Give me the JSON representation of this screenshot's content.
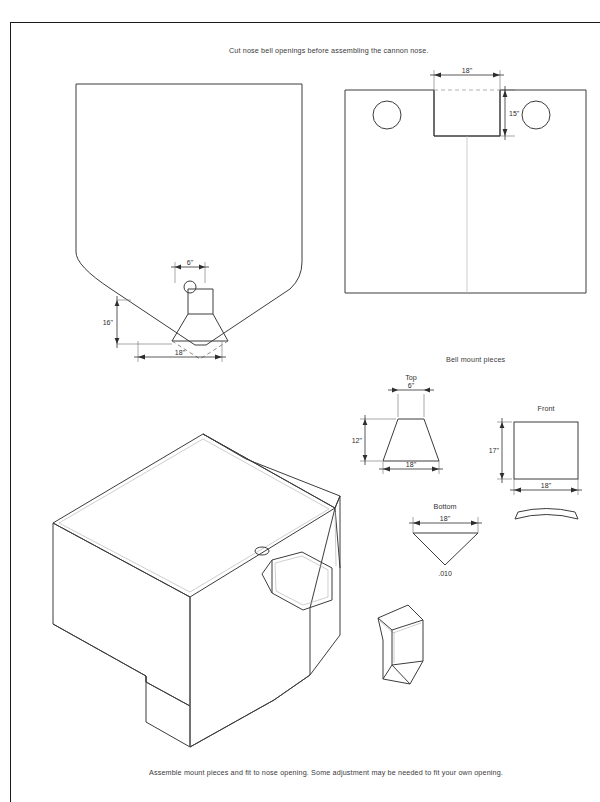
{
  "document": {
    "title": "Cannon nose bell opening templates",
    "background_color": "#ffffff",
    "line_color": "#3c3c3c",
    "frame_color": "#1a1a1a"
  },
  "captions": {
    "top": "Cut nose bell openings before assembling the cannon nose.",
    "bottom": "Assemble mount pieces and fit to nose opening. Some adjustment may be needed to fit your own opening."
  },
  "sections": {
    "bell_mount_label": "Bell mount pieces"
  },
  "views": {
    "nose_profile": {
      "name": "nose-profile-view",
      "dimensions": [
        {
          "label": "6\"",
          "orientation": "horizontal"
        },
        {
          "label": "16\"",
          "orientation": "vertical"
        },
        {
          "label": "18\"",
          "orientation": "horizontal"
        }
      ]
    },
    "nose_top_panel": {
      "name": "nose-top-panel-view",
      "dimensions": [
        {
          "label": "18\"",
          "orientation": "horizontal"
        },
        {
          "label": "15\"",
          "orientation": "vertical"
        }
      ]
    },
    "top_piece": {
      "label": "Top",
      "dimensions": [
        {
          "label": "6\"",
          "orientation": "horizontal"
        },
        {
          "label": "12\"",
          "orientation": "vertical"
        },
        {
          "label": "18\"",
          "orientation": "horizontal"
        }
      ]
    },
    "front_piece": {
      "label": "Front",
      "dimensions": [
        {
          "label": "17\"",
          "orientation": "vertical"
        },
        {
          "label": "18\"",
          "orientation": "horizontal"
        }
      ]
    },
    "bottom_piece": {
      "label": "Bottom",
      "dimensions": [
        {
          "label": "18\"",
          "orientation": "horizontal"
        }
      ],
      "note": ".010"
    },
    "assembly_iso": {
      "name": "cannon-nose-isometric"
    },
    "mount_iso": {
      "name": "bell-mount-isometric"
    }
  }
}
